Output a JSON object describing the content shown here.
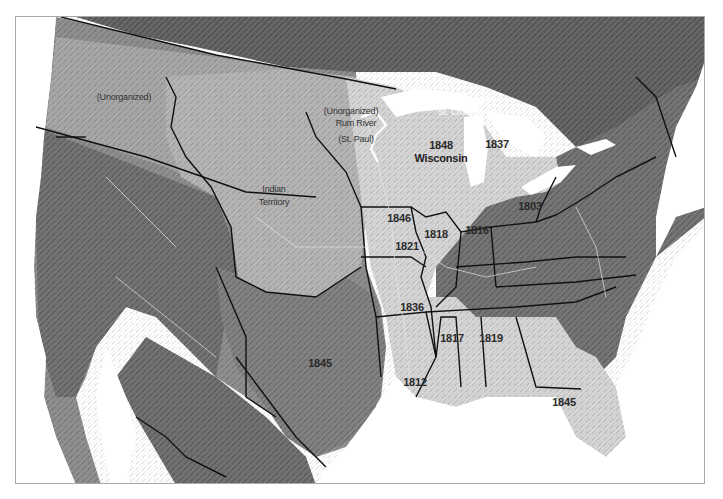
{
  "map": {
    "type": "shaded-relief historical map",
    "colors": {
      "ocean": "#ffffff",
      "canada_dark": "#5a5a5a",
      "west_terrain": "#8e8e8e",
      "west_dark": "#6a6a6a",
      "east_terrain": "#6e6e6e",
      "highlight_states": "#d6d6d6",
      "unorganized_light": "#b4b4b4",
      "texas": "#7c7c7c",
      "border": "#111111",
      "lakes": "#ffffff",
      "frame": "#a8a8a8"
    },
    "labels": {
      "unorganized_west": "(Unorganized)",
      "unorganized_mn": "(Unorganized)",
      "indian_territory_line1": "Indian",
      "indian_territory_line2": "Territory",
      "rum_river": "Rum River",
      "st_paul": "(St. Paul)",
      "st_louis_river": "St. Louis River",
      "st_croix_river": "St. Croix River",
      "wisconsin_year": "1848",
      "wisconsin_name": "Wisconsin",
      "michigan": "1837",
      "iowa": "1846",
      "illinois": "1818",
      "indiana": "1816",
      "ohio": "1803",
      "missouri": "1821",
      "arkansas": "1836",
      "mississippi": "1817",
      "alabama": "1819",
      "louisiana": "1812",
      "florida": "1845",
      "texas": "1845"
    }
  }
}
